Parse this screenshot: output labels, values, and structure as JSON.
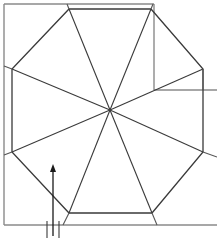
{
  "diagram": {
    "type": "octagon-floor-plan",
    "colors": {
      "frame": "#8a8a8a",
      "octagon": "#3a3a3a",
      "arrow": "#1a1a1a",
      "background": "#ffffff"
    },
    "frame": {
      "left_x": 4,
      "top_y": 4,
      "bottom_y": 225,
      "top_right_x": 154,
      "right_edge_x": 217,
      "notch_y": 90
    },
    "center": {
      "x": 110,
      "y": 110
    },
    "octagon_vertices": [
      {
        "x": 69,
        "y": 9
      },
      {
        "x": 151,
        "y": 9
      },
      {
        "x": 203,
        "y": 69
      },
      {
        "x": 203,
        "y": 152
      },
      {
        "x": 152,
        "y": 213
      },
      {
        "x": 69,
        "y": 213
      },
      {
        "x": 12,
        "y": 152
      },
      {
        "x": 12,
        "y": 69
      }
    ],
    "arrow": {
      "x": 53,
      "y_start": 236,
      "y_end": 166,
      "direction": "up"
    },
    "tick_marks_x": [
      47,
      53,
      59
    ]
  }
}
